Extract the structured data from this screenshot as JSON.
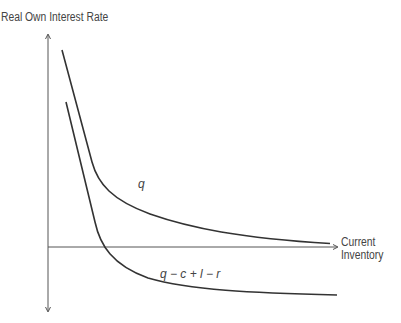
{
  "diagram": {
    "y_axis_label": "Real Own Interest Rate",
    "x_axis_label_line1": "Current",
    "x_axis_label_line2": "Inventory",
    "curves": [
      {
        "name": "q",
        "label": "q"
      },
      {
        "name": "q-c+l-r",
        "label": "q − c + l − r"
      }
    ],
    "colors": {
      "axis": "#555555",
      "curve": "#333333"
    }
  }
}
